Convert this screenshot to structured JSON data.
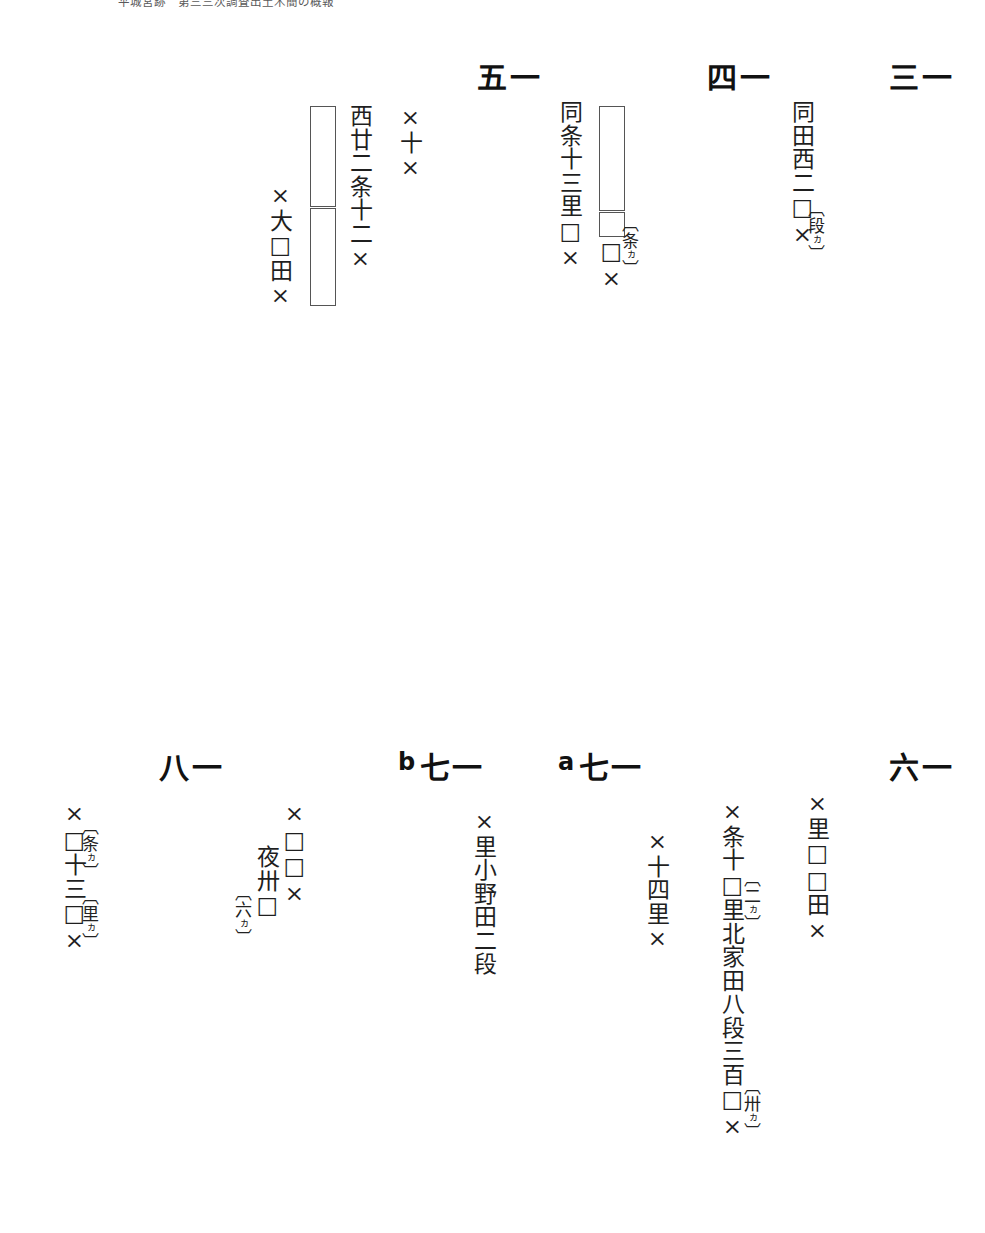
{
  "page": {
    "header_text": "平城宮跡　第三三次調査出土木簡の概報",
    "background": "#ffffff",
    "ink": "#1a1a1a"
  },
  "entries": [
    {
      "id": "13",
      "number": "一三",
      "columns": [
        {
          "text": "同田西二□×"
        }
      ],
      "glosses": [
        {
          "text": "段",
          "kana": "ヵ"
        }
      ]
    },
    {
      "id": "14",
      "number": "一四",
      "columns": [
        {
          "text": "同条十三里□×"
        },
        {
          "text": "□×"
        }
      ],
      "glosses": [
        {
          "text": "条",
          "kana": "ヵ"
        }
      ],
      "lacuna_bars": 2
    },
    {
      "id": "15",
      "number": "一五",
      "columns": [
        {
          "text": "×十×"
        },
        {
          "text": "西廿二条十二×"
        },
        {
          "text": "×大□田×"
        }
      ],
      "glosses": [],
      "lacuna_bars": 2
    },
    {
      "id": "16",
      "number": "一六",
      "columns": [
        {
          "text": "×里□□田×"
        },
        {
          "text": "×条十□里北家田八段三百□×"
        }
      ],
      "glosses": [
        {
          "text": "二",
          "kana": "ヵ"
        },
        {
          "text": "卅",
          "kana": "ヵ"
        }
      ]
    },
    {
      "id": "17a",
      "number": "一七",
      "number_suffix": "a",
      "columns": [
        {
          "text": "×十四里×"
        }
      ],
      "glosses": []
    },
    {
      "id": "17b",
      "number": "一七",
      "number_suffix": "b",
      "columns": [
        {
          "text": "×里小野田二段"
        }
      ],
      "glosses": []
    },
    {
      "id": "18",
      "number": "一八",
      "columns": [
        {
          "text": "×□□×"
        },
        {
          "text": "夜卅□"
        },
        {
          "text": "×□十三□×"
        }
      ],
      "glosses": [
        {
          "text": "六",
          "kana": "ヵ"
        },
        {
          "text": "条",
          "kana": "ヵ"
        },
        {
          "text": "里",
          "kana": "ヵ"
        }
      ]
    }
  ]
}
